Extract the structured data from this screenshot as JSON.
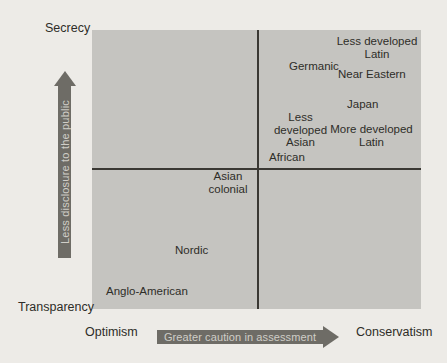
{
  "colors": {
    "page_background": "#edebe7",
    "plot_fill": "#c5c4c0",
    "divider_line": "#3a3833",
    "label_text": "#2e2d28",
    "arrow_fill": "#6e6c66",
    "arrow_text": "#d0cec8"
  },
  "chart_data": {
    "type": "scatter",
    "title": "",
    "x_axis": {
      "left_label": "Optimism",
      "right_label": "Conservatism",
      "arrow_annotation": "Greater caution in assessment",
      "range": [
        0,
        1
      ]
    },
    "y_axis": {
      "bottom_label": "Transparency",
      "top_label": "Secrecy",
      "arrow_annotation": "Less disclosure to the public",
      "range": [
        0,
        1
      ]
    },
    "quadrant_dividers": {
      "x": 0.5,
      "y": 0.5
    },
    "grid": false,
    "legend": false,
    "points": [
      {
        "label": "Less developed\nLatin",
        "x": 0.87,
        "y": 0.95
      },
      {
        "label": "Germanic",
        "x": 0.67,
        "y": 0.87
      },
      {
        "label": "Near Eastern",
        "x": 0.85,
        "y": 0.84
      },
      {
        "label": "Japan",
        "x": 0.82,
        "y": 0.73
      },
      {
        "label": "Less developed\nAsian",
        "x": 0.63,
        "y": 0.66
      },
      {
        "label": "More developed\nLatin",
        "x": 0.85,
        "y": 0.62
      },
      {
        "label": "African",
        "x": 0.6,
        "y": 0.54
      },
      {
        "label": "Asian\ncolonial",
        "x": 0.41,
        "y": 0.45
      },
      {
        "label": "Nordic",
        "x": 0.31,
        "y": 0.21
      },
      {
        "label": "Anglo-American",
        "x": 0.17,
        "y": 0.06
      }
    ]
  }
}
